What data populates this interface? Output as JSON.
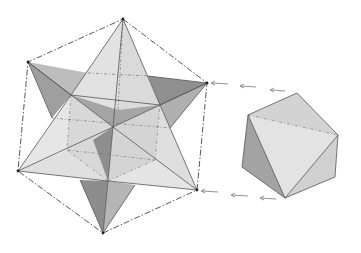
{
  "figure": {
    "left_figure": "stellated-octahedron",
    "right_figure": "octahedron",
    "arrow_rows": 2,
    "arrows_per_row": 3,
    "colors": {
      "background": "#ffffff",
      "light_face": "#e4e4e4",
      "mid_face": "#c9c9c9",
      "dark_face": "#9c9c9c",
      "line": "#444444"
    }
  }
}
